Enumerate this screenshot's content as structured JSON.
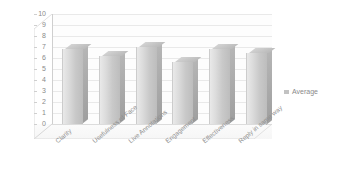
{
  "chart_data": {
    "type": "bar",
    "title": "",
    "subtitle": "",
    "xlabel": "",
    "ylabel": "",
    "ylim": [
      0,
      10
    ],
    "ytick_step": 1,
    "yticks": [
      "10",
      "9",
      "8",
      "7",
      "6",
      "5",
      "4",
      "3",
      "2",
      "1",
      "0"
    ],
    "grid": true,
    "legend_position": "right",
    "style": "3d-column-grayscale",
    "categories": [
      "Clarity",
      "Usefulness of Face",
      "Live Annotations",
      "Engagement",
      "Effectiveness",
      "Reply in same way"
    ],
    "series": [
      {
        "name": "Average",
        "values": [
          6.8,
          6.2,
          7.0,
          5.6,
          6.8,
          6.5
        ]
      }
    ]
  },
  "legend": {
    "entries": [
      {
        "label": "Average",
        "color": "#c2c2c2"
      }
    ]
  },
  "colors": {
    "bar_face": "#d2d2d2",
    "bar_side": "#a8a8a8",
    "bar_top": "#c6c6c6",
    "gridline": "#e9e9e9",
    "axis": "#cfcfcf",
    "text": "#8a8a8a",
    "background": "#ffffff"
  }
}
